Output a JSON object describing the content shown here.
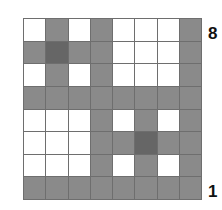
{
  "diagram": {
    "type": "8x8 grid",
    "colors": {
      "W": "#ffffff",
      "G": "#8a8a8a",
      "D": "#666666",
      "gridline": "#6e6e6e"
    },
    "rows": [
      {
        "rank": "8",
        "cells": [
          "W",
          "G",
          "W",
          "G",
          "W",
          "W",
          "W",
          "G"
        ]
      },
      {
        "rank": "7",
        "cells": [
          "G",
          "D",
          "G",
          "G",
          "W",
          "W",
          "W",
          "G"
        ]
      },
      {
        "rank": "6",
        "cells": [
          "W",
          "G",
          "W",
          "G",
          "W",
          "W",
          "W",
          "G"
        ]
      },
      {
        "rank": "5",
        "cells": [
          "G",
          "G",
          "G",
          "G",
          "G",
          "G",
          "G",
          "G"
        ]
      },
      {
        "rank": "4",
        "cells": [
          "W",
          "W",
          "W",
          "G",
          "W",
          "G",
          "W",
          "G"
        ]
      },
      {
        "rank": "3",
        "cells": [
          "W",
          "W",
          "W",
          "G",
          "G",
          "D",
          "G",
          "G"
        ]
      },
      {
        "rank": "2",
        "cells": [
          "W",
          "W",
          "W",
          "G",
          "W",
          "G",
          "W",
          "G"
        ]
      },
      {
        "rank": "1",
        "cells": [
          "G",
          "G",
          "G",
          "G",
          "G",
          "G",
          "G",
          "G"
        ]
      }
    ],
    "labels": {
      "top": "8",
      "bottom": "1"
    }
  }
}
